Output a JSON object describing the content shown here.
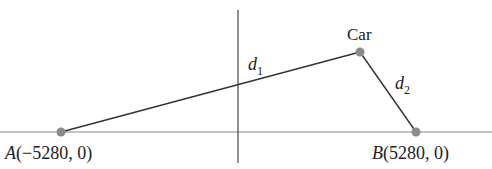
{
  "diagram": {
    "points": {
      "A": {
        "label_name": "A",
        "label_coords": "(−5280, 0)",
        "x": -5280,
        "y": 0
      },
      "B": {
        "label_name": "B",
        "label_coords": "(5280, 0)",
        "x": 5280,
        "y": 0
      },
      "car": {
        "label": "Car"
      }
    },
    "segments": {
      "d1": {
        "name": "d",
        "subscript": "1"
      },
      "d2": {
        "name": "d",
        "subscript": "2"
      }
    },
    "colors": {
      "axis": "#888888",
      "segment": "#333333",
      "point": "#8a8a8a",
      "text": "#222222"
    }
  }
}
